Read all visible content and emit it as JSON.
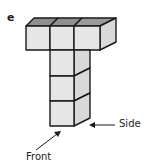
{
  "figure": {
    "label": "e",
    "annotations": {
      "side": "Side",
      "front": "Front"
    },
    "colors": {
      "front_face": "#e6e6e6",
      "top_face": "#8f8f8f",
      "side_face": "#d9d9d9",
      "edge": "#1a1a1a"
    }
  }
}
